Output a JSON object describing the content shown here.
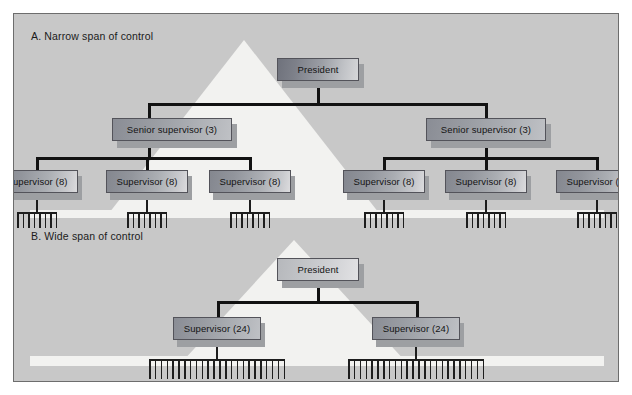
{
  "figure": {
    "background_color": "#c8c8c8",
    "border_color": "#6d6d6d"
  },
  "sections": [
    {
      "id": "a",
      "label": "A. Narrow span of control",
      "root": {
        "label": "President"
      },
      "level2": [
        {
          "label": "Senior supervisor (3)"
        },
        {
          "label": "Senior supervisor (3)"
        }
      ],
      "level3": [
        {
          "label": "Supervisor (8)",
          "subordinates": 8
        },
        {
          "label": "Supervisor (8)",
          "subordinates": 8
        },
        {
          "label": "Supervisor (8)",
          "subordinates": 8
        },
        {
          "label": "Supervisor (8)",
          "subordinates": 8
        },
        {
          "label": "Supervisor (8)",
          "subordinates": 8
        },
        {
          "label": "Supervisor (8)",
          "subordinates": 8
        }
      ]
    },
    {
      "id": "b",
      "label": "B. Wide span of control",
      "root": {
        "label": "President"
      },
      "level2": [
        {
          "label": "Supervisor (24)",
          "subordinates": 24
        },
        {
          "label": "Supervisor (24)",
          "subordinates": 24
        }
      ]
    }
  ],
  "chart_data": {
    "type": "diagram",
    "variants": [
      {
        "name": "A. Narrow span of control",
        "levels": 4,
        "nodes": [
          {
            "level": 1,
            "label": "President",
            "reports": 2
          },
          {
            "level": 2,
            "label": "Senior supervisor (3)",
            "reports": 3
          },
          {
            "level": 2,
            "label": "Senior supervisor (3)",
            "reports": 3
          },
          {
            "level": 3,
            "label": "Supervisor (8)",
            "reports": 8
          },
          {
            "level": 3,
            "label": "Supervisor (8)",
            "reports": 8
          },
          {
            "level": 3,
            "label": "Supervisor (8)",
            "reports": 8
          },
          {
            "level": 3,
            "label": "Supervisor (8)",
            "reports": 8
          },
          {
            "level": 3,
            "label": "Supervisor (8)",
            "reports": 8
          },
          {
            "level": 3,
            "label": "Supervisor (8)",
            "reports": 8
          }
        ],
        "total_workers": 48
      },
      {
        "name": "B. Wide span of control",
        "levels": 3,
        "nodes": [
          {
            "level": 1,
            "label": "President",
            "reports": 2
          },
          {
            "level": 2,
            "label": "Supervisor (24)",
            "reports": 24
          },
          {
            "level": 2,
            "label": "Supervisor (24)",
            "reports": 24
          }
        ],
        "total_workers": 48
      }
    ]
  }
}
